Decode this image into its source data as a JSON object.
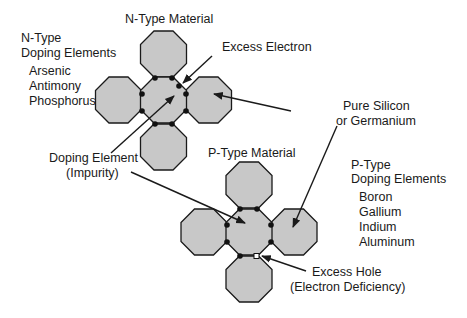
{
  "colors": {
    "atom_fill": "#c8c8c8",
    "stroke": "#1a1a1a",
    "background": "#ffffff"
  },
  "n_type": {
    "title": "N-Type Material",
    "doping_heading": [
      "N-Type",
      "Doping Elements"
    ],
    "elements": [
      "Arsenic",
      "Antimony",
      "Phosphorus"
    ],
    "excess_label": "Excess Electron"
  },
  "p_type": {
    "title": "P-Type Material",
    "doping_heading": [
      "P-Type",
      "Doping Elements"
    ],
    "elements": [
      "Boron",
      "Gallium",
      "Indium",
      "Aluminum"
    ],
    "excess_label": [
      "Excess Hole",
      "(Electron Deficiency)"
    ]
  },
  "shared_labels": {
    "pure": [
      "Pure Silicon",
      "or Germanium"
    ],
    "doping_element": [
      "Doping Element",
      "(Impurity)"
    ]
  }
}
